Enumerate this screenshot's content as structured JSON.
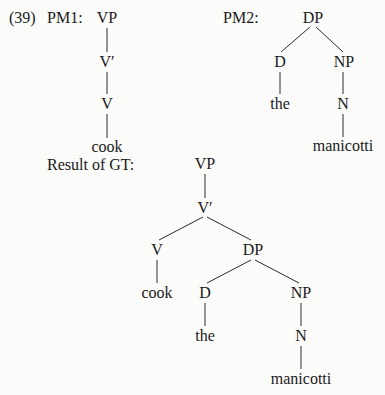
{
  "example_number": "(39)",
  "pm1": {
    "label": "PM1:",
    "nodes": {
      "vp": "VP",
      "vbar": "V′",
      "v": "V",
      "leaf": "cook"
    }
  },
  "pm2": {
    "label": "PM2:",
    "nodes": {
      "dp": "DP",
      "d": "D",
      "np": "NP",
      "the": "the",
      "n": "N",
      "leaf": "manicotti"
    }
  },
  "result": {
    "label": "Result of GT:",
    "nodes": {
      "vp": "VP",
      "vbar": "V′",
      "v": "V",
      "cook": "cook",
      "dp": "DP",
      "d": "D",
      "the": "the",
      "np": "NP",
      "n": "N",
      "manicotti": "manicotti"
    }
  }
}
